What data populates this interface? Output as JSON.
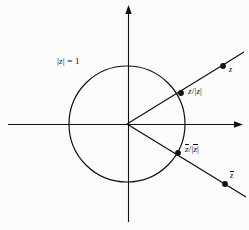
{
  "figure": {
    "type": "complex-plane-diagram",
    "background_color": "#fbfbfa",
    "ink_color": "#111111",
    "labels": {
      "unit_circle": "|z| = 1",
      "z_normalized": "z/|z|",
      "zbar_normalized": "z̄/|z̄|",
      "z_point": "z",
      "zbar_point": "z̄"
    },
    "geometry": {
      "origin": {
        "x": 127,
        "y": 124
      },
      "circle_radius": 58,
      "real_axis": {
        "x1": 8,
        "y1": 124,
        "x2": 243,
        "y2": 124,
        "arrow": "right"
      },
      "imaginary_axis": {
        "x1": 128,
        "y1": 6,
        "x2": 128,
        "y2": 222,
        "arrow": "up"
      },
      "ray_z": {
        "from": {
          "x": 127,
          "y": 124
        },
        "to": {
          "x": 244,
          "y": 52
        }
      },
      "ray_zbar": {
        "from": {
          "x": 127,
          "y": 124
        },
        "to": {
          "x": 246,
          "y": 197
        }
      },
      "points": [
        {
          "name": "z-normalized-point",
          "x": 181,
          "y": 93
        },
        {
          "name": "z-point",
          "x": 223,
          "y": 66
        },
        {
          "name": "zbar-normalized-point",
          "x": 178,
          "y": 153
        },
        {
          "name": "zbar-point",
          "x": 225,
          "y": 184
        }
      ]
    }
  }
}
